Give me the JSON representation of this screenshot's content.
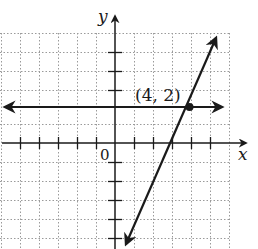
{
  "figure": {
    "type": "coordinate-plane-graph",
    "x_axis_label": "x",
    "y_axis_label": "y",
    "origin_label": "0",
    "point_label": "(4, 2)",
    "point": {
      "x": 4,
      "y": 2
    },
    "x_range": [
      -6,
      6
    ],
    "y_range": [
      -6,
      5
    ],
    "lines": [
      {
        "name": "horizontal line",
        "equation": "y = 2",
        "arrows": "both"
      },
      {
        "name": "slanted line",
        "equation": "y = 2x - 6",
        "arrows": "both"
      }
    ],
    "colors": {
      "ink": "#1a1a1a",
      "grid": "#9a9a9a",
      "background": "#ffffff"
    }
  }
}
